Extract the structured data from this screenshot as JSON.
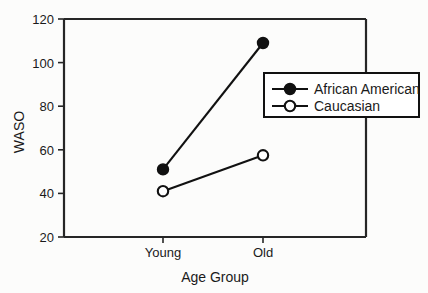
{
  "chart_data": {
    "type": "line",
    "title": "",
    "subtitle": "",
    "xlabel": "Age Group",
    "ylabel": "WASO",
    "categories": [
      "Young",
      "Old"
    ],
    "x": [
      0,
      1
    ],
    "ylim": [
      20,
      120
    ],
    "yticks": [
      20,
      40,
      60,
      80,
      100,
      120
    ],
    "ytick_labels": [
      "20",
      "40",
      "60",
      "80",
      "100",
      "120"
    ],
    "xtick_labels": [
      "Young",
      "Old"
    ],
    "grid": false,
    "legend_position": "right-inside-upper",
    "series": [
      {
        "name": "African American",
        "values": [
          51,
          109
        ],
        "marker": "filled-circle",
        "color": "#111111"
      },
      {
        "name": "Caucasian",
        "values": [
          41,
          57.5
        ],
        "marker": "open-circle",
        "color": "#111111"
      }
    ],
    "legend_entries": [
      "African American",
      "Caucasian"
    ],
    "annotations": []
  },
  "axes": {
    "y_axis_title": "WASO",
    "x_axis_title": "Age Group",
    "y_tick_0": "20",
    "y_tick_1": "40",
    "y_tick_2": "60",
    "y_tick_3": "80",
    "y_tick_4": "100",
    "y_tick_5": "120",
    "x_tick_0": "Young",
    "x_tick_1": "Old"
  },
  "legend": {
    "entry_0_label": "African American",
    "entry_1_label": "Caucasian"
  },
  "colors": {
    "ink": "#111111",
    "frame": "#262626",
    "background": "#fcfcfb",
    "marker_fill_filled": "#111111",
    "marker_fill_open": "#ffffff"
  }
}
